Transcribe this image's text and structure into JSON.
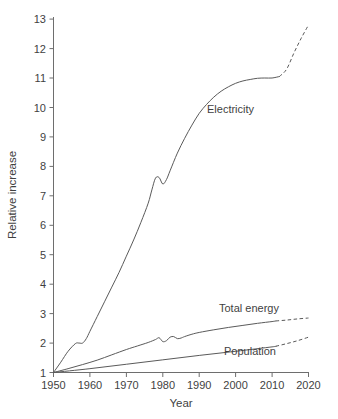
{
  "chart_data": {
    "type": "line",
    "title": "",
    "xlabel": "Year",
    "ylabel": "Relative increase",
    "xlim": [
      1950,
      2020
    ],
    "ylim": [
      1,
      13
    ],
    "grid": false,
    "legend_position": "inline-annotations",
    "xticks": [
      1950,
      1960,
      1970,
      1980,
      1990,
      2000,
      2010,
      2020
    ],
    "yticks": [
      1,
      2,
      3,
      4,
      5,
      6,
      7,
      8,
      9,
      10,
      11,
      12,
      13
    ],
    "xtick_labels": [
      "1950",
      "1960",
      "1970",
      "1980",
      "1990",
      "2000",
      "2010",
      "2020"
    ],
    "ytick_labels": [
      "1",
      "2",
      "3",
      "4",
      "5",
      "6",
      "7",
      "8",
      "9",
      "10",
      "11",
      "12",
      "13"
    ],
    "line_color": "#5a5a5a",
    "series": [
      {
        "name": "Electricity",
        "label": "Electricity",
        "style": "solid-then-dashed",
        "dashed_from_x": 2012,
        "x": [
          1950,
          1952,
          1954,
          1956,
          1957,
          1958,
          1959,
          1960,
          1962,
          1964,
          1966,
          1968,
          1970,
          1972,
          1974,
          1976,
          1977,
          1978,
          1979,
          1980,
          1981,
          1982,
          1984,
          1986,
          1988,
          1990,
          1992,
          1994,
          1996,
          1998,
          2000,
          2002,
          2004,
          2006,
          2008,
          2010,
          2012,
          2014,
          2016,
          2018,
          2020
        ],
        "y": [
          1.0,
          1.35,
          1.72,
          1.98,
          2.0,
          2.0,
          2.15,
          2.4,
          2.9,
          3.4,
          3.9,
          4.4,
          4.95,
          5.5,
          6.1,
          6.75,
          7.2,
          7.6,
          7.62,
          7.4,
          7.55,
          7.85,
          8.45,
          8.95,
          9.4,
          9.8,
          10.1,
          10.35,
          10.55,
          10.7,
          10.82,
          10.9,
          10.95,
          10.99,
          11.0,
          11.0,
          11.05,
          11.3,
          11.85,
          12.35,
          12.8
        ]
      },
      {
        "name": "Total energy",
        "label": "Total energy",
        "style": "solid-then-dashed",
        "dashed_from_x": 2011,
        "x": [
          1950,
          1954,
          1958,
          1962,
          1966,
          1970,
          1973,
          1976,
          1978,
          1979,
          1980,
          1981,
          1982,
          1983,
          1984,
          1985,
          1986,
          1988,
          1990,
          1994,
          1998,
          2002,
          2006,
          2010,
          2011,
          2014,
          2017,
          2020
        ],
        "y": [
          1.0,
          1.13,
          1.27,
          1.42,
          1.6,
          1.78,
          1.9,
          2.02,
          2.12,
          2.18,
          2.05,
          2.08,
          2.2,
          2.22,
          2.15,
          2.17,
          2.22,
          2.3,
          2.36,
          2.45,
          2.53,
          2.6,
          2.67,
          2.73,
          2.75,
          2.78,
          2.82,
          2.85
        ]
      },
      {
        "name": "Population",
        "label": "Population",
        "style": "solid-then-dashed",
        "dashed_from_x": 2011,
        "x": [
          1950,
          1960,
          1970,
          1980,
          1990,
          2000,
          2010,
          2011,
          2014,
          2017,
          2020
        ],
        "y": [
          1.0,
          1.13,
          1.28,
          1.43,
          1.58,
          1.72,
          1.87,
          1.89,
          1.98,
          2.08,
          2.2
        ]
      }
    ],
    "annotations": [
      {
        "text": "Electricity",
        "x": 2002,
        "y": 9.62
      },
      {
        "text": "Total energy",
        "x": 2010,
        "y": 3.05
      },
      {
        "text": "Population",
        "x": 2010,
        "y": 1.62
      }
    ]
  }
}
